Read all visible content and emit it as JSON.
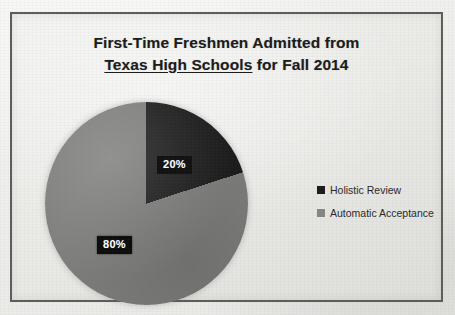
{
  "chart_data": {
    "type": "pie",
    "title": "First-Time Freshmen Admitted from Texas High Schools for Fall 2014",
    "title_lines": {
      "line1": "First-Time Freshmen Admitted from",
      "line2_underlined": "Texas High Schools",
      "line2_rest": " for Fall 2014"
    },
    "categories": [
      "Holistic Review",
      "Automatic Acceptance"
    ],
    "values": [
      20,
      80
    ],
    "value_labels": [
      "20%",
      "80%"
    ],
    "unit": "%",
    "colors": [
      "#1c1c1c",
      "#7d7d7b"
    ],
    "start_angle_deg": 0,
    "direction": "clockwise",
    "legend_position": "right",
    "grid": false,
    "xlabel": "",
    "ylabel": ""
  },
  "chart": {
    "title_line1": "First-Time Freshmen Admitted from",
    "title_line2_underlined": "Texas High Schools",
    "title_line2_rest": " for Fall 2014",
    "slices": [
      {
        "label": "Holistic Review",
        "value": 20,
        "value_label": "20%",
        "color": "#1c1c1c"
      },
      {
        "label": "Automatic Acceptance",
        "value": 80,
        "value_label": "80%",
        "color": "#7d7d7b"
      }
    ],
    "legend": [
      {
        "label": "Holistic Review",
        "color": "#1c1c1c"
      },
      {
        "label": "Automatic Acceptance",
        "color": "#868684"
      }
    ]
  }
}
